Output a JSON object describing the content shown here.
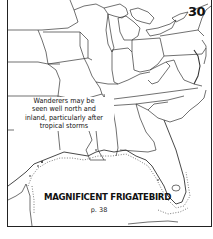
{
  "map": {
    "number": "30",
    "species_name": "MAGNIFICENT FRIGATEBIRD",
    "page_reference": "p. 38",
    "note_lines": [
      "Wanderers may be",
      "seen well north and",
      "inland, particularly after",
      "tropical storms"
    ],
    "region": "Eastern United States and Gulf of Mexico coast",
    "range_style": "dotted line along Gulf coast and southern Florida",
    "colors": {
      "background": "#ffffff",
      "lines": "#222222",
      "text": "#111111"
    }
  }
}
